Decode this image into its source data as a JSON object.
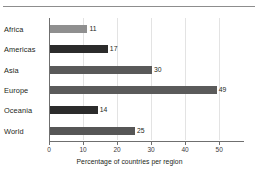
{
  "divider": {
    "name": "top-horizontal-rule"
  },
  "chart_data": {
    "type": "bar",
    "orientation": "horizontal",
    "title": "",
    "subtitle": "",
    "xlabel": "Percentage of countries per region",
    "ylabel": "",
    "categories": [
      "Africa",
      "Americas",
      "Asia",
      "Europe",
      "Oceania",
      "World"
    ],
    "values": [
      11,
      17,
      30,
      49,
      14,
      25
    ],
    "value_labels": [
      "11",
      "17",
      "30",
      "49",
      "14",
      "25"
    ],
    "bar_colors": [
      "#8f8f8f",
      "#2b2b2b",
      "#595959",
      "#5b5b5b",
      "#2b2b2b",
      "#565656"
    ],
    "xlim": [
      0,
      57
    ],
    "xticks": [
      0,
      10,
      20,
      30,
      40,
      50
    ],
    "xtick_labels": [
      "0",
      "10",
      "20",
      "30",
      "40",
      "50"
    ],
    "grid": true,
    "grid_axis": "x",
    "grid_color": "#e3e3e3",
    "axis_color": "#6f6f6f",
    "legend": null,
    "legend_position": "none",
    "background": "#ffffff",
    "text_color": "#231f20"
  }
}
